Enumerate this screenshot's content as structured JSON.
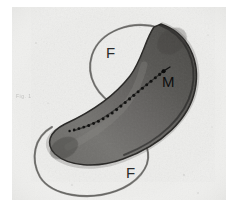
{
  "figure": {
    "kind": "transmission-electron-micrograph",
    "background_color": "#ececea",
    "page_color": "#ffffff"
  },
  "labels": {
    "flagellum_top": "F",
    "flagellum_bottom": "F",
    "magnetosome": "M",
    "corner_annotation": "Fig. 1"
  },
  "structures": {
    "cell_body": {
      "name": "cell-body",
      "description": "curved comma-shaped bacterial cell",
      "fill_color": "#5d5c5a",
      "outline_color": "#2e2d2c"
    },
    "flagellum_top": {
      "name": "flagellum-upper",
      "description": "coiled polar flagellum forming an open loop at the upper pole",
      "stroke_color": "#6f6e6b"
    },
    "flagellum_bottom": {
      "name": "flagellum-lower",
      "description": "coiled polar flagellum forming an open loop at the lower pole",
      "stroke_color": "#6f6e6b"
    },
    "magnetosome_chain": {
      "name": "magnetosome-chain",
      "description": "linear chain of electron-dense magnetosome particles along the concave edge",
      "particle_color": "#141414",
      "particle_count": 22
    },
    "leader_line": {
      "name": "magnetosome-leader-line",
      "description": "pointer from the M label to the magnetosome chain",
      "stroke_color": "#111111"
    }
  }
}
